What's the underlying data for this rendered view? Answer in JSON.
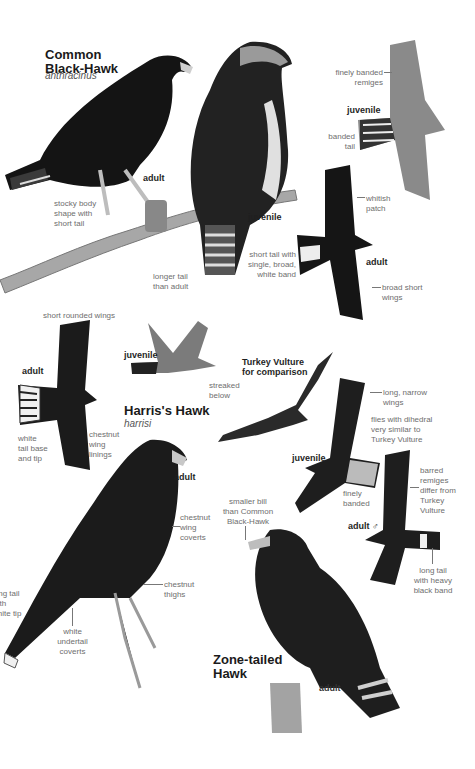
{
  "page": {
    "background": "#ffffff",
    "ink_color": "#1a1a1a",
    "label_color": "#6e6e6e"
  },
  "species": {
    "common_black_hawk": {
      "title_line1": "Common",
      "title_line2": "Black-Hawk",
      "scientific": "anthracinus",
      "labels": {
        "adult_perched": "adult",
        "juvenile_perched": "juvenile",
        "juvenile_flight": "juvenile",
        "adult_flight": "adult"
      },
      "notes": {
        "stocky": [
          "stocky body",
          "shape with",
          "short tail"
        ],
        "longer_tail": [
          "longer tail",
          "than adult"
        ],
        "finely_banded_remiges": [
          "finely banded",
          "remiges"
        ],
        "banded_tail": [
          "banded",
          "tail"
        ],
        "whitish_patch": [
          "whitish",
          "patch"
        ],
        "short_tail": [
          "short tail with",
          "single, broad,",
          "white band"
        ],
        "broad_wings": [
          "broad short",
          "wings"
        ]
      }
    },
    "harris_hawk": {
      "title": "Harris's Hawk",
      "scientific": "harrisi",
      "labels": {
        "adult_flight": "adult",
        "juvenile_flight": "juvenile",
        "adult_perched": "adult"
      },
      "notes": {
        "short_rounded_wings": "short rounded wings",
        "streaked_below": [
          "streaked",
          "below"
        ],
        "white_tail_base": [
          "white",
          "tail base",
          "and tip"
        ],
        "chestnut_wing_linings": [
          "chestnut",
          "wing",
          "linings"
        ],
        "chestnut_wing_coverts": [
          "chestnut",
          "wing",
          "coverts"
        ],
        "chestnut_thighs": [
          "chestnut",
          "thighs"
        ],
        "long_tail_white_tip": [
          "long tail",
          "with",
          "white tip"
        ],
        "white_undertail": [
          "white",
          "undertail",
          "coverts"
        ]
      }
    },
    "turkey_vulture": {
      "title_line1": "Turkey Vulture",
      "title_line2": "for comparison"
    },
    "zone_tailed_hawk": {
      "title_line1": "Zone-tailed",
      "title_line2": "Hawk",
      "labels": {
        "juvenile_flight": "juvenile",
        "adult_male_flight": "adult ♂",
        "adult_perched": "adult"
      },
      "notes": {
        "long_narrow_wings": [
          "long, narrow",
          "wings"
        ],
        "dihedral": [
          "flies with dihedral",
          "very similar to",
          "Turkey Vulture"
        ],
        "finely_banded": [
          "finely",
          "banded"
        ],
        "barred_remiges": [
          "barred",
          "remiges",
          "differ from",
          "Turkey",
          "Vulture"
        ],
        "long_tail_black_band": [
          "long tail",
          "with heavy",
          "black band"
        ],
        "smaller_bill": [
          "smaller bill",
          "than Common",
          "Black-Hawk"
        ]
      }
    }
  }
}
